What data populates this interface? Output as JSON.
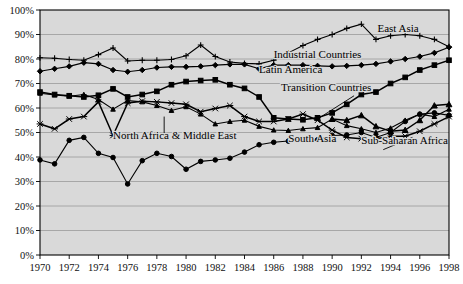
{
  "chart_data": {
    "type": "line",
    "title": "",
    "subtitle": "",
    "xlabel": "",
    "ylabel": "",
    "xlim": [
      1970,
      1998
    ],
    "ylim": [
      0,
      100
    ],
    "y_tick_suffix": "%",
    "grid": true,
    "legend_position": "inline-annotations",
    "background_color": "#d9d9d9",
    "gridline_color": "#9a9a9a",
    "line_color": "#000000",
    "x": [
      1970,
      1971,
      1972,
      1973,
      1974,
      1975,
      1976,
      1977,
      1978,
      1979,
      1980,
      1981,
      1982,
      1983,
      1984,
      1985,
      1986,
      1987,
      1988,
      1989,
      1990,
      1991,
      1992,
      1993,
      1994,
      1995,
      1996,
      1997,
      1998
    ],
    "categories": [
      "1970",
      "1971",
      "1972",
      "1973",
      "1974",
      "1975",
      "1976",
      "1977",
      "1978",
      "1979",
      "1980",
      "1981",
      "1982",
      "1983",
      "1984",
      "1985",
      "1986",
      "1987",
      "1988",
      "1989",
      "1990",
      "1991",
      "1992",
      "1993",
      "1994",
      "1995",
      "1996",
      "1997",
      "1998"
    ],
    "x_ticks": [
      1970,
      1972,
      1974,
      1976,
      1978,
      1980,
      1982,
      1984,
      1986,
      1988,
      1990,
      1992,
      1994,
      1996,
      1998
    ],
    "x_tick_labels": [
      "1970",
      "1972",
      "1974",
      "1976",
      "1978",
      "1980",
      "1982",
      "1984",
      "1986",
      "1988",
      "1990",
      "1992",
      "1994",
      "1996",
      "1998"
    ],
    "y_ticks": [
      0,
      10,
      20,
      30,
      40,
      50,
      60,
      70,
      80,
      90,
      100
    ],
    "y_tick_labels": [
      "0%",
      "10%",
      "20%",
      "30%",
      "40%",
      "50%",
      "60%",
      "70%",
      "80%",
      "90%",
      "100%"
    ],
    "series": [
      {
        "name": "East Asia",
        "marker": "plus",
        "label_x": 1993.1,
        "label_y": 91.0,
        "label_anchor": "start",
        "leader": null,
        "values": [
          80.5,
          80.3,
          79.8,
          79.5,
          81.8,
          84.5,
          79.2,
          79.5,
          79.5,
          79.8,
          81.3,
          85.7,
          81.0,
          78.8,
          78.2,
          78.0,
          79.5,
          82.5,
          85.5,
          88.0,
          90.0,
          92.5,
          94.2,
          88.0,
          89.5,
          90.0,
          89.5,
          88.0,
          85.0
        ]
      },
      {
        "name": "Industrial Countries",
        "marker": "diamond",
        "label_x": 1986.0,
        "label_y": 80.5,
        "label_anchor": "start",
        "leader": null,
        "values": [
          75.0,
          76.0,
          77.0,
          78.5,
          78.0,
          75.5,
          74.8,
          75.5,
          76.5,
          76.8,
          76.8,
          77.0,
          77.5,
          77.8,
          77.8,
          76.0,
          77.5,
          77.5,
          77.5,
          77.2,
          77.0,
          77.2,
          77.5,
          78.0,
          79.0,
          80.0,
          81.0,
          82.5,
          84.8
        ]
      },
      {
        "name": "Latin America",
        "marker": "square",
        "label_x": 1985.0,
        "label_y": 74.2,
        "label_anchor": "start",
        "leader": null,
        "values": [
          66.5,
          65.5,
          65.0,
          64.5,
          65.2,
          67.8,
          64.5,
          65.5,
          66.8,
          69.5,
          70.8,
          71.2,
          71.5,
          69.5,
          68.0,
          64.5,
          56.0,
          55.5,
          55.2,
          56.0,
          58.0,
          61.5,
          65.5,
          66.5,
          70.0,
          72.5,
          75.5,
          77.5,
          79.5
        ]
      },
      {
        "name": "Transition Countries",
        "marker": "triangle",
        "label_x": 1986.5,
        "label_y": 67.0,
        "label_anchor": "start",
        "leader": {
          "x1": 1991.5,
          "y1": 65.0,
          "x2": 1989.0,
          "y2": 55.5
        },
        "values": [
          null,
          null,
          null,
          null,
          null,
          null,
          null,
          null,
          null,
          null,
          null,
          null,
          null,
          null,
          null,
          null,
          null,
          null,
          null,
          null,
          55.5,
          55.0,
          57.0,
          52.5,
          50.5,
          51.0,
          55.0,
          61.0,
          61.5
        ]
      },
      {
        "name": "North Africa & Middle East",
        "marker": "triangle-small",
        "label_x": 1975.0,
        "label_y": 47.5,
        "label_anchor": "start",
        "leader": {
          "x1": 1978.5,
          "y1": 49.5,
          "x2": 1978.5,
          "y2": 56.5
        },
        "values": [
          66.0,
          65.3,
          64.8,
          65.5,
          63.5,
          59.5,
          63.0,
          62.5,
          61.0,
          59.0,
          60.5,
          57.5,
          53.5,
          54.5,
          55.0,
          52.5,
          51.0,
          50.8,
          51.5,
          52.0,
          55.5,
          52.8,
          51.5,
          50.0,
          51.8,
          55.0,
          57.5,
          56.5,
          59.5
        ]
      },
      {
        "name": "South Asia",
        "marker": "circle",
        "label_x": 1987.0,
        "label_y": 46.0,
        "label_anchor": "start",
        "leader": null,
        "values": [
          38.8,
          37.2,
          46.8,
          48.0,
          41.5,
          39.8,
          29.0,
          38.5,
          41.5,
          40.2,
          35.0,
          38.2,
          38.8,
          39.5,
          42.0,
          45.0,
          46.0,
          46.5,
          46.8,
          47.0,
          48.8,
          49.0,
          50.0,
          48.0,
          50.0,
          54.5,
          57.5,
          58.0,
          57.0
        ]
      },
      {
        "name": "Sub-Saharan Africa",
        "marker": "cross",
        "label_x": 1992.0,
        "label_y": 45.5,
        "label_anchor": "start",
        "leader": {
          "x1": 1995.5,
          "y1": 48.0,
          "x2": 1993.5,
          "y2": 43.0
        },
        "values": [
          53.5,
          51.5,
          55.5,
          56.5,
          62.5,
          48.8,
          62.0,
          62.8,
          62.5,
          62.0,
          61.5,
          58.5,
          59.8,
          61.0,
          56.5,
          54.5,
          54.5,
          55.5,
          57.5,
          55.0,
          51.0,
          48.0,
          47.5,
          47.5,
          48.5,
          48.5,
          50.5,
          53.5,
          56.5
        ]
      }
    ]
  }
}
